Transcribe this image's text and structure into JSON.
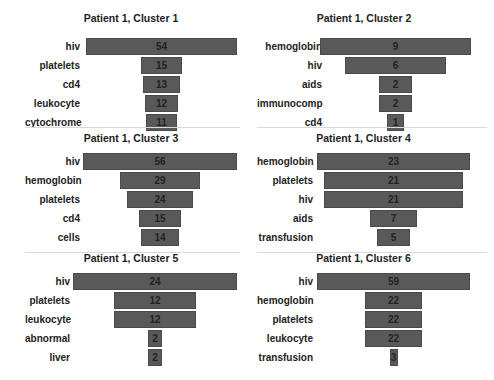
{
  "chart_data": [
    {
      "type": "bar",
      "orientation": "horizontal-funnel",
      "title": "Patient 1, Cluster 1",
      "categories": [
        "hiv",
        "platelets",
        "cd4",
        "leukocyte",
        "cytochrome"
      ],
      "values": [
        54,
        15,
        13,
        12,
        11
      ],
      "bar_color": "#595959",
      "grid": false
    },
    {
      "type": "bar",
      "orientation": "horizontal-funnel",
      "title": "Patient 1, Cluster 2",
      "categories": [
        "hemoglobin",
        "hiv",
        "aids",
        "immunocomp",
        "cd4"
      ],
      "values": [
        9,
        6,
        2,
        2,
        1
      ],
      "bar_color": "#595959",
      "grid": false
    },
    {
      "type": "bar",
      "orientation": "horizontal-funnel",
      "title": "Patient 1, Cluster 3",
      "categories": [
        "hiv",
        "hemoglobin",
        "platelets",
        "cd4",
        "cells"
      ],
      "values": [
        56,
        29,
        24,
        15,
        14
      ],
      "bar_color": "#595959",
      "grid": false
    },
    {
      "type": "bar",
      "orientation": "horizontal-funnel",
      "title": "Patient 1, Cluster 4",
      "categories": [
        "hemoglobin",
        "platelets",
        "hiv",
        "aids",
        "transfusion"
      ],
      "values": [
        23,
        21,
        21,
        7,
        5
      ],
      "bar_color": "#595959",
      "grid": false
    },
    {
      "type": "bar",
      "orientation": "horizontal-funnel",
      "title": "Patient 1, Cluster 5",
      "categories": [
        "hiv",
        "platelets",
        "leukocyte",
        "abnormal",
        "liver"
      ],
      "values": [
        24,
        12,
        12,
        2,
        2
      ],
      "bar_color": "#595959",
      "grid": false
    },
    {
      "type": "bar",
      "orientation": "horizontal-funnel",
      "title": "Patient 1, Cluster 6",
      "categories": [
        "hiv",
        "hemoglobin",
        "platelets",
        "leukocyte",
        "transfusion"
      ],
      "values": [
        59,
        22,
        22,
        22,
        3
      ],
      "bar_color": "#595959",
      "grid": false
    }
  ]
}
